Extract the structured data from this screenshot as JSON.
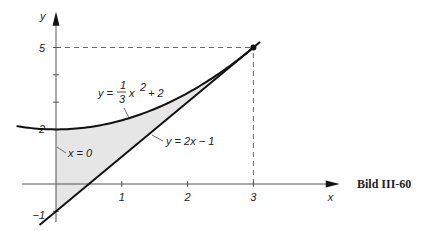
{
  "chart_data": {
    "type": "area",
    "title": "",
    "caption": "Bild III-60",
    "xlabel": "x",
    "ylabel": "y",
    "xlim": [
      -0.75,
      4.5
    ],
    "ylim": [
      -1.5,
      6.2
    ],
    "x_ticks": [
      1,
      2,
      3
    ],
    "x_tick_labels": [
      "1",
      "2",
      "3"
    ],
    "y_ticks": [
      -1,
      2,
      5
    ],
    "y_tick_labels": [
      "−1",
      "2",
      "5"
    ],
    "y_minor_ticks": [
      3,
      4
    ],
    "grid": false,
    "series": [
      {
        "name": "y = 1/3 x^2 + 2",
        "function": "parabola",
        "a": 0.3333,
        "c": 2,
        "x_range": [
          -0.6,
          3.0
        ],
        "label_text": "y = ",
        "label_frac_num": "1",
        "label_frac_den": "3",
        "label_rest": "x",
        "label_exp": "2",
        "label_tail": "+ 2"
      },
      {
        "name": "y = 2x − 1",
        "function": "line",
        "m": 2,
        "b": -1,
        "x_range": [
          -0.25,
          3.1
        ],
        "label_text": "y = 2x − 1"
      },
      {
        "name": "x = 0",
        "function": "vertical",
        "x": 0,
        "label_text": "x = 0"
      }
    ],
    "shaded_region": {
      "between": [
        "y = 1/3 x^2 + 2",
        "y = 2x − 1"
      ],
      "x_range": [
        0,
        3
      ],
      "color": "#e6e6e6"
    },
    "intersection_point": {
      "x": 3,
      "y": 5
    },
    "dashed_guides": [
      {
        "from": [
          0,
          5
        ],
        "to": [
          3,
          5
        ]
      },
      {
        "from": [
          3,
          0
        ],
        "to": [
          3,
          5
        ]
      }
    ]
  }
}
